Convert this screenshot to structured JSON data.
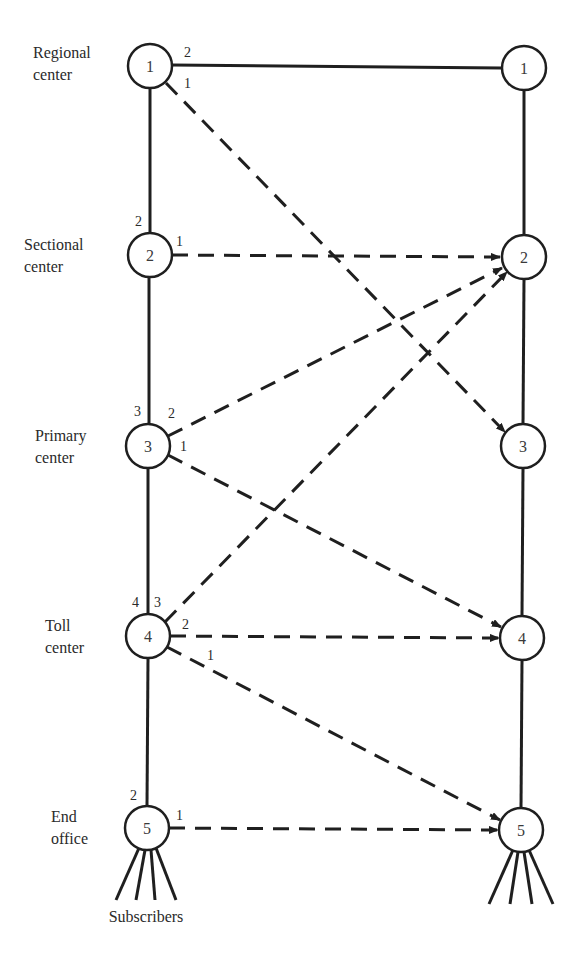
{
  "diagram": {
    "levels": [
      {
        "label_line1": "Regional",
        "label_line2": "center",
        "node": "1"
      },
      {
        "label_line1": "Sectional",
        "label_line2": "center",
        "node": "2"
      },
      {
        "label_line1": "Primary",
        "label_line2": "center",
        "node": "3"
      },
      {
        "label_line1": "Toll",
        "label_line2": "center",
        "node": "4"
      },
      {
        "label_line1": "End",
        "label_line2": "office",
        "node": "5"
      }
    ],
    "right_nodes": [
      "1",
      "2",
      "3",
      "4",
      "5"
    ],
    "route_labels": {
      "n1_a": "2",
      "n1_b": "1",
      "n2_up": "2",
      "n2_a": "1",
      "n3_up": "3",
      "n3_a": "2",
      "n3_b": "1",
      "n4_up": "4",
      "n4_a": "3",
      "n4_b": "2",
      "n4_c": "1",
      "n5_up": "2",
      "n5_a": "1"
    },
    "subscribers_label": "Subscribers",
    "edges": [
      {
        "from": "L1",
        "to": "R1",
        "type": "solid",
        "order": "2"
      },
      {
        "from": "L1",
        "to": "R3",
        "type": "dashed",
        "order": "1"
      },
      {
        "from": "L2",
        "to": "R2",
        "type": "dashed",
        "order": "1"
      },
      {
        "from": "L3",
        "to": "R2",
        "type": "dashed",
        "order": "2"
      },
      {
        "from": "L3",
        "to": "R4",
        "type": "dashed",
        "order": "1"
      },
      {
        "from": "L4",
        "to": "R2",
        "type": "dashed",
        "order": "3"
      },
      {
        "from": "L4",
        "to": "R4",
        "type": "dashed",
        "order": "2"
      },
      {
        "from": "L4",
        "to": "R5",
        "type": "dashed",
        "order": "1"
      },
      {
        "from": "L5",
        "to": "R5",
        "type": "dashed",
        "order": "1"
      }
    ]
  }
}
